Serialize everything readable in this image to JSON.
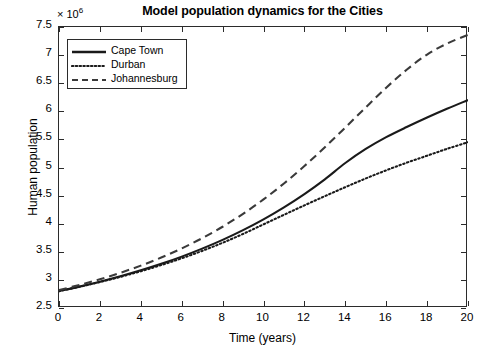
{
  "chart_data": {
    "type": "line",
    "title": "Model population dynamics for the Cities",
    "xlabel": "Time (years)",
    "ylabel": "Human population",
    "y_multiplier_text": "× 10",
    "y_multiplier_exponent": "6",
    "xlim": [
      0,
      20
    ],
    "ylim": [
      2500000,
      7500000
    ],
    "xticks": [
      0,
      2,
      4,
      6,
      8,
      10,
      12,
      14,
      16,
      18,
      20
    ],
    "xtick_labels": [
      "0",
      "2",
      "4",
      "6",
      "8",
      "10",
      "12",
      "14",
      "16",
      "18",
      "20"
    ],
    "yticks": [
      2500000,
      3000000,
      3500000,
      4000000,
      4500000,
      5000000,
      5500000,
      6000000,
      6500000,
      7000000,
      7500000
    ],
    "ytick_labels": [
      "2.5",
      "3",
      "3.5",
      "4",
      "4.5",
      "5",
      "5.5",
      "6",
      "6.5",
      "7",
      "7.5"
    ],
    "grid": false,
    "legend_position": "upper left",
    "x": [
      0,
      1,
      2,
      3,
      4,
      5,
      6,
      7,
      8,
      9,
      10,
      11,
      12,
      13,
      14,
      15,
      16,
      17,
      18,
      19,
      20
    ],
    "series": [
      {
        "name": "Cape Town",
        "linestyle": "solid",
        "color": "#1a1a1a",
        "linewidth": 2.1,
        "values": [
          2800000,
          2880000,
          2968000,
          3064000,
          3170000,
          3286000,
          3414000,
          3556000,
          3712000,
          3886000,
          4078000,
          4292000,
          4528000,
          4790000,
          5080000,
          5330000,
          5540000,
          5720000,
          5890000,
          6050000,
          6200000
        ]
      },
      {
        "name": "Durban",
        "linestyle": "dotted",
        "color": "#1a1a1a",
        "linewidth": 2.1,
        "values": [
          2800000,
          2878000,
          2962000,
          3054000,
          3154000,
          3264000,
          3384000,
          3516000,
          3660000,
          3818000,
          3988000,
          4158000,
          4326000,
          4490000,
          4650000,
          4805000,
          4950000,
          5085000,
          5210000,
          5335000,
          5450000
        ]
      },
      {
        "name": "Johannesburg",
        "linestyle": "dashed",
        "color": "#3a3a3a",
        "linewidth": 2.1,
        "values": [
          2820000,
          2910000,
          3012000,
          3126000,
          3254000,
          3398000,
          3560000,
          3742000,
          3946000,
          4176000,
          4432000,
          4716000,
          5026000,
          5360000,
          5712000,
          6070000,
          6420000,
          6740000,
          7010000,
          7210000,
          7360000
        ]
      }
    ]
  },
  "legend": {
    "items": [
      {
        "label": "Cape Town",
        "style": "solid"
      },
      {
        "label": "Durban",
        "style": "dotted"
      },
      {
        "label": "Johannesburg",
        "style": "dashed"
      }
    ]
  }
}
